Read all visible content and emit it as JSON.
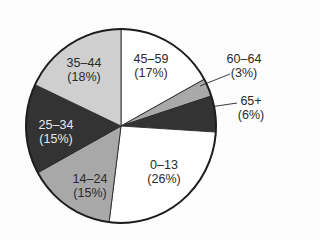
{
  "chart_data": {
    "type": "pie",
    "title": "",
    "start_angle_deg": 0,
    "direction": "clockwise",
    "center": [
      121,
      126
    ],
    "radius": [
      95,
      97
    ],
    "slices": [
      {
        "label": "45–59",
        "pct_label": "(17%)",
        "value": 17,
        "color": "#ffffff",
        "label_pos": [
          151,
          66
        ],
        "text": "dark"
      },
      {
        "label": "60–64",
        "pct_label": "(3%)",
        "value": 3,
        "color": "#a9a9a9",
        "label_pos": [
          244,
          66
        ],
        "text": "dark",
        "leader": [
          [
            200,
            86
          ],
          [
            230,
            74
          ]
        ]
      },
      {
        "label": "65+",
        "pct_label": "(6%)",
        "value": 6,
        "color": "#333333",
        "label_pos": [
          251,
          108
        ],
        "text": "dark",
        "leader": [
          [
            210,
            107
          ],
          [
            237,
            103
          ]
        ]
      },
      {
        "label": "0–13",
        "pct_label": "(26%)",
        "value": 26,
        "color": "#ffffff",
        "label_pos": [
          164,
          172
        ],
        "text": "dark"
      },
      {
        "label": "14–24",
        "pct_label": "(15%)",
        "value": 15,
        "color": "#a8a8a8",
        "label_pos": [
          90,
          186
        ],
        "text": "dark"
      },
      {
        "label": "25–34",
        "pct_label": "(15%)",
        "value": 15,
        "color": "#333333",
        "label_pos": [
          56,
          132
        ],
        "text": "light"
      },
      {
        "label": "35–44",
        "pct_label": "(18%)",
        "value": 18,
        "color": "#cfcfcf",
        "label_pos": [
          84,
          70
        ],
        "text": "dark"
      }
    ],
    "categories": [
      "45–59",
      "60–64",
      "65+",
      "0–13",
      "14–24",
      "25–34",
      "35–44"
    ],
    "values": [
      17,
      3,
      6,
      26,
      15,
      15,
      18
    ],
    "legend": "none (direct labels)"
  }
}
